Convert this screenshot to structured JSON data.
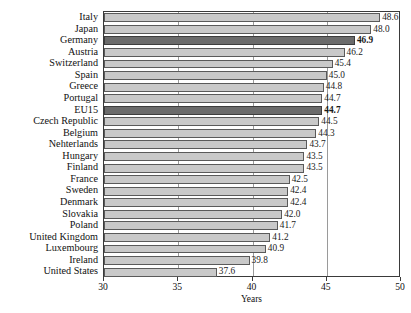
{
  "chart_data": {
    "type": "bar",
    "orientation": "horizontal",
    "title": "",
    "xlabel": "Years",
    "ylabel": "",
    "xlim": [
      30,
      50
    ],
    "xticks": [
      30,
      35,
      40,
      45,
      50
    ],
    "grid": true,
    "grid_axis": "x",
    "legend": null,
    "value_label_format": "one decimal",
    "categories": [
      "Italy",
      "Japan",
      "Germany",
      "Austria",
      "Switzerland",
      "Spain",
      "Greece",
      "Portugal",
      "EU15",
      "Czech Republic",
      "Belgium",
      "Nehterlands",
      "Hungary",
      "Finland",
      "France",
      "Sweden",
      "Denmark",
      "Slovakia",
      "Poland",
      "United Kingdom",
      "Luxembourg",
      "Ireland",
      "United States"
    ],
    "values": [
      48.6,
      48.0,
      46.9,
      46.2,
      45.4,
      45.0,
      44.8,
      44.7,
      44.7,
      44.5,
      44.3,
      43.7,
      43.5,
      43.5,
      42.5,
      42.4,
      42.4,
      42.0,
      41.7,
      41.2,
      40.9,
      39.8,
      37.6
    ],
    "value_labels": [
      "48.6",
      "48.0",
      "46.9",
      "46.2",
      "45.4",
      "45.0",
      "44.8",
      "44.7",
      "44.7",
      "44.5",
      "44.3",
      "43.7",
      "43.5",
      "43.5",
      "42.5",
      "42.4",
      "42.4",
      "42.0",
      "41.7",
      "41.2",
      "40.9",
      "39.8",
      "37.6"
    ],
    "highlighted": [
      "Germany",
      "EU15"
    ],
    "colors": {
      "bar": "#c9c9c9",
      "bar_highlight": "#6b6b6b",
      "bar_border": "#5a5a5a",
      "bar_highlight_border": "#3d3d3d",
      "axis": "#3a3a3a",
      "gridline": "#9a9a9a",
      "text": "#111111",
      "background": "#ffffff"
    }
  },
  "xtick_labels": [
    "30",
    "35",
    "40",
    "45",
    "50"
  ],
  "axis_title": {
    "x": "Years"
  }
}
